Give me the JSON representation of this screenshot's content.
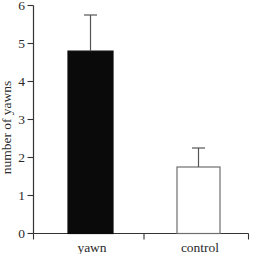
{
  "chart_data": {
    "type": "bar",
    "title": "",
    "xlabel": "",
    "ylabel": "number of yawns",
    "categories": [
      "yawn",
      "control"
    ],
    "values": [
      4.8,
      1.75
    ],
    "errors_plus": [
      0.95,
      0.5
    ],
    "bar_fill_colors": [
      "#0a0a0a",
      "#ffffff"
    ],
    "bar_edge_colors": [
      "#0a0a0a",
      "#6e6e6e"
    ],
    "ylim": [
      0,
      6
    ],
    "yticks": [
      0,
      1,
      2,
      3,
      4,
      5,
      6
    ],
    "grid": false,
    "legend": null
  },
  "colors": {
    "background": "#ffffff",
    "axis": "#333333",
    "tick_text": "#2a2a2a",
    "error_bar": "#555555"
  }
}
